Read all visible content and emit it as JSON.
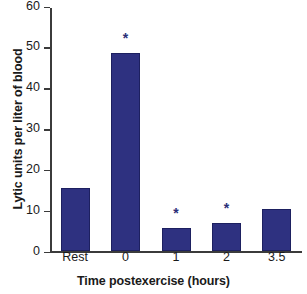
{
  "chart_data": {
    "type": "bar",
    "title": "",
    "xlabel": "Time postexercise (hours)",
    "ylabel": "Lytic units per liter of blood",
    "categories": [
      "Rest",
      "0",
      "1",
      "2",
      "3.5"
    ],
    "values": [
      15.5,
      48.5,
      5.6,
      6.9,
      10.3
    ],
    "annotations": [
      "",
      "*",
      "*",
      "*",
      ""
    ],
    "ylim": [
      0,
      60
    ],
    "yticks": [
      0,
      10,
      20,
      30,
      40,
      50,
      60
    ],
    "ytick_labels": [
      "0",
      "10",
      "20",
      "30",
      "40",
      "50",
      "60"
    ],
    "grid": false,
    "legend": null,
    "bar_color": "#2e3180",
    "axis_color": "#3b3b3b"
  }
}
